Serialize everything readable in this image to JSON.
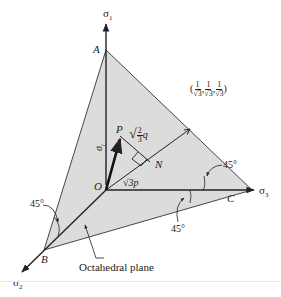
{
  "diagram": {
    "type": "octahedral-plane-stress-space",
    "colors": {
      "plane_fill": "#dcdcdc",
      "line": "#222222",
      "background": "#ffffff"
    },
    "axes": {
      "sigma1": "σ",
      "sigma1_sub": "1",
      "sigma2": "σ",
      "sigma2_sub": "2",
      "sigma3": "σ",
      "sigma3_sub": "3"
    },
    "points": {
      "A": "A",
      "B": "B",
      "C": "C",
      "O": "O",
      "P": "P",
      "N": "N"
    },
    "vector_label": "σ",
    "vector_sub": "i",
    "hydrostatic_direction": {
      "open": "(",
      "close": ")",
      "comp_num": "1",
      "comp_den": "√3",
      "sep": ","
    },
    "deviatoric_label": {
      "root": "√",
      "num": "2",
      "den": "3",
      "var": "q"
    },
    "hydrostatic_length": "√3p",
    "angles": {
      "left": "45°",
      "right_upper": "45°",
      "right_lower": "45°"
    },
    "plane_label": "Octahedral plane"
  }
}
